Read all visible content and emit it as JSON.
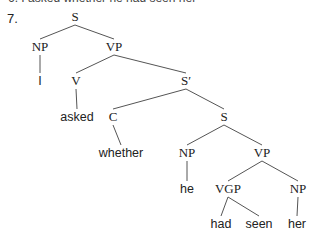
{
  "previous_example": {
    "number": "6.",
    "text": "I asked whether he had seen her"
  },
  "example": {
    "number": "7."
  },
  "tree": {
    "nodes": [
      {
        "id": "S0",
        "label": "S",
        "type": "cat",
        "x": 75,
        "y": 21
      },
      {
        "id": "NP1",
        "label": "NP",
        "type": "cat",
        "x": 40,
        "y": 51
      },
      {
        "id": "VP1",
        "label": "VP",
        "type": "cat",
        "x": 114,
        "y": 51
      },
      {
        "id": "I",
        "label": "I",
        "type": "word",
        "x": 40,
        "y": 85
      },
      {
        "id": "V",
        "label": "V",
        "type": "cat",
        "x": 76,
        "y": 85
      },
      {
        "id": "Sbar",
        "label": "S′",
        "type": "cat",
        "x": 186,
        "y": 85
      },
      {
        "id": "asked",
        "label": "asked",
        "type": "word",
        "x": 77,
        "y": 121
      },
      {
        "id": "C",
        "label": "C",
        "type": "cat",
        "x": 113,
        "y": 121
      },
      {
        "id": "S2",
        "label": "S",
        "type": "cat",
        "x": 224,
        "y": 121
      },
      {
        "id": "whether",
        "label": "whether",
        "type": "word",
        "x": 121,
        "y": 157
      },
      {
        "id": "NP2",
        "label": "NP",
        "type": "cat",
        "x": 187,
        "y": 157
      },
      {
        "id": "VP2",
        "label": "VP",
        "type": "cat",
        "x": 262,
        "y": 157
      },
      {
        "id": "he",
        "label": "he",
        "type": "word",
        "x": 187,
        "y": 193
      },
      {
        "id": "VGP",
        "label": "VGP",
        "type": "cat",
        "x": 228,
        "y": 193
      },
      {
        "id": "NP3",
        "label": "NP",
        "type": "cat",
        "x": 298,
        "y": 193
      },
      {
        "id": "had",
        "label": "had",
        "type": "word",
        "x": 221,
        "y": 228
      },
      {
        "id": "seen",
        "label": "seen",
        "type": "word",
        "x": 259,
        "y": 228
      },
      {
        "id": "her",
        "label": "her",
        "type": "word",
        "x": 297,
        "y": 228
      }
    ],
    "edges": [
      [
        "S0",
        "NP1"
      ],
      [
        "S0",
        "VP1"
      ],
      [
        "NP1",
        "I"
      ],
      [
        "VP1",
        "V"
      ],
      [
        "VP1",
        "Sbar"
      ],
      [
        "V",
        "asked"
      ],
      [
        "Sbar",
        "C"
      ],
      [
        "Sbar",
        "S2"
      ],
      [
        "C",
        "whether"
      ],
      [
        "S2",
        "NP2"
      ],
      [
        "S2",
        "VP2"
      ],
      [
        "NP2",
        "he"
      ],
      [
        "VP2",
        "VGP"
      ],
      [
        "VP2",
        "NP3"
      ],
      [
        "VGP",
        "had"
      ],
      [
        "VGP",
        "seen"
      ],
      [
        "NP3",
        "her"
      ]
    ]
  }
}
